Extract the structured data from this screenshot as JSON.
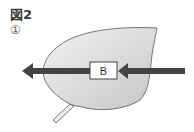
{
  "figure": {
    "title": "図2",
    "sublabel": "①"
  },
  "diagram": {
    "box_label": "B",
    "colors": {
      "leaf_fill_start": "#f4f4f4",
      "leaf_fill_end": "#c8c8c8",
      "leaf_outline": "#555555",
      "arrow": "#444444",
      "box_fill": "#ffffff",
      "box_stroke": "#444444"
    }
  }
}
